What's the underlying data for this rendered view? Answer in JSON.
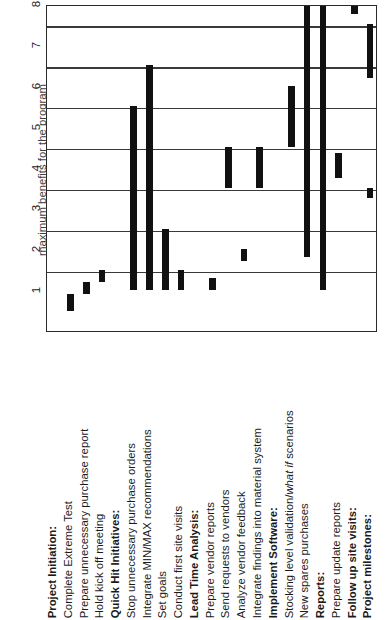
{
  "chart_data": {
    "type": "bar",
    "title": "Project Plan by Months",
    "xlabel": "",
    "ylabel": "Project Plan by Months",
    "orientation": "gantt-rotated-90",
    "ylim": [
      0,
      8
    ],
    "grid": true,
    "legend": null,
    "tick_labels": [
      "1",
      "2",
      "3",
      "4",
      "5",
      "6",
      "7",
      "8"
    ],
    "caption_clipped": "maximum benefits for the program",
    "categories": [
      "Project Initiation:",
      "Complete Extreme Test",
      "Prepare unnecessary purchase report",
      "Hold kick off meeting",
      "Quick Hit Initiatives:",
      "Stop unnecessary purchase orders",
      "Integrate MIN/MAX recommendations",
      "Set goals",
      "Conduct first site visits",
      "Lead Time Analysis:",
      "Prepare vendor reports",
      "Send requests to vendors",
      "Analyze vendor feedback",
      "Integrate findings into material system",
      "Implement Software:",
      "Stocking level validation/what if scenarios",
      "New spares purchases",
      "Reports:",
      "Prepare update reports",
      "Follow up site visits:",
      "Project milestones:"
    ],
    "tasks": [
      {
        "label": "Project Initiation:",
        "group": true,
        "start": null,
        "end": null
      },
      {
        "label": "Complete Extreme Test",
        "group": false,
        "start": 0.55,
        "end": 0.95
      },
      {
        "label": "Prepare unnecessary purchase report",
        "group": false,
        "start": 0.95,
        "end": 1.25
      },
      {
        "label": "Hold kick off meeting",
        "group": false,
        "start": 1.25,
        "end": 1.55
      },
      {
        "label": "Quick Hit Initiatives:",
        "group": true,
        "start": null,
        "end": null
      },
      {
        "label": "Stop unnecessary purchase orders",
        "group": false,
        "start": 1.05,
        "end": 5.55
      },
      {
        "label": "Integrate MIN/MAX recommendations",
        "group": false,
        "start": 1.05,
        "end": 6.55
      },
      {
        "label": "Set goals",
        "group": false,
        "start": 1.05,
        "end": 2.55
      },
      {
        "label": "Conduct first site visits",
        "group": false,
        "start": 1.05,
        "end": 1.55
      },
      {
        "label": "Lead Time Analysis:",
        "group": true,
        "start": null,
        "end": null
      },
      {
        "label": "Prepare vendor reports",
        "group": false,
        "start": 1.05,
        "end": 1.35
      },
      {
        "label": "Send requests to vendors",
        "group": false,
        "start": 3.55,
        "end": 4.55
      },
      {
        "label": "Analyze vendor feedback",
        "group": false,
        "start": 1.75,
        "end": 2.05
      },
      {
        "label": "Integrate findings into material system",
        "group": false,
        "start": 3.55,
        "end": 4.55
      },
      {
        "label": "Implement Software:",
        "group": true,
        "start": null,
        "end": null
      },
      {
        "label": "Stocking level validation/what if scenarios",
        "group": false,
        "start": 4.55,
        "end": 6.05
      },
      {
        "label": "New spares purchases",
        "group": false,
        "start": 1.85,
        "end": 8.0
      },
      {
        "label": "Reports:",
        "group": true,
        "start": 1.05,
        "end": 8.0
      },
      {
        "label": "Prepare update reports",
        "group": false,
        "start": 3.8,
        "end": 4.4
      },
      {
        "label": "Follow up site visits:",
        "group": true,
        "start": 7.8,
        "end": 8.0
      },
      {
        "label": "Project milestones:",
        "group": true,
        "start": 6.55,
        "end": 7.55
      }
    ],
    "extra_marks": [
      {
        "row": 20,
        "start": 6.25,
        "end": 6.55
      },
      {
        "row": 20,
        "start": 3.3,
        "end": 3.55
      }
    ]
  },
  "labels": {
    "axis_title": "Project Plan by Months",
    "caption": "maximum benefits for the program",
    "ticks": [
      "1",
      "2",
      "3",
      "4",
      "5",
      "6",
      "7",
      "8"
    ]
  }
}
